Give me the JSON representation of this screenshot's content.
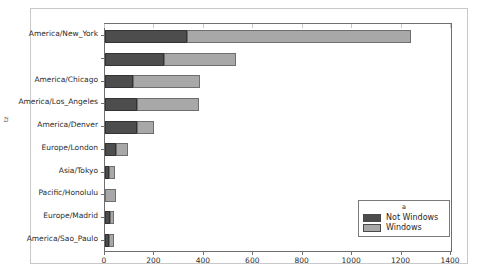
{
  "chart_data": {
    "type": "bar",
    "orientation": "horizontal",
    "stacked": true,
    "title": "",
    "xlabel": "",
    "ylabel": "tz",
    "xlim": [
      0,
      1400
    ],
    "xticks": [
      0,
      200,
      400,
      600,
      800,
      1000,
      1200,
      1400
    ],
    "xtick_labels": [
      "0",
      "200",
      "400",
      "600",
      "800",
      "1000",
      "1200",
      "1400"
    ],
    "grid": false,
    "legend": {
      "title": "a",
      "position": "lower right",
      "entries": [
        {
          "name": "Not Windows",
          "color": "#4d4d4d"
        },
        {
          "name": "Windows",
          "color": "#a8a8a8"
        }
      ]
    },
    "categories": [
      "America/New_York",
      "",
      "America/Chicago",
      "America/Los_Angeles",
      "America/Denver",
      "Europe/London",
      "Asia/Tokyo",
      "Pacific/Honolulu",
      "Europe/Madrid",
      "America/Sao_Paulo"
    ],
    "series": [
      {
        "name": "Not Windows",
        "color": "#4d4d4d",
        "values": [
          330,
          240,
          115,
          130,
          130,
          45,
          16,
          0,
          20,
          18
        ]
      },
      {
        "name": "Windows",
        "color": "#a8a8a8",
        "values": [
          910,
          290,
          270,
          250,
          68,
          50,
          25,
          44,
          15,
          18
        ]
      }
    ],
    "totals": [
      1240,
      530,
      385,
      380,
      198,
      95,
      41,
      44,
      35,
      36
    ]
  }
}
